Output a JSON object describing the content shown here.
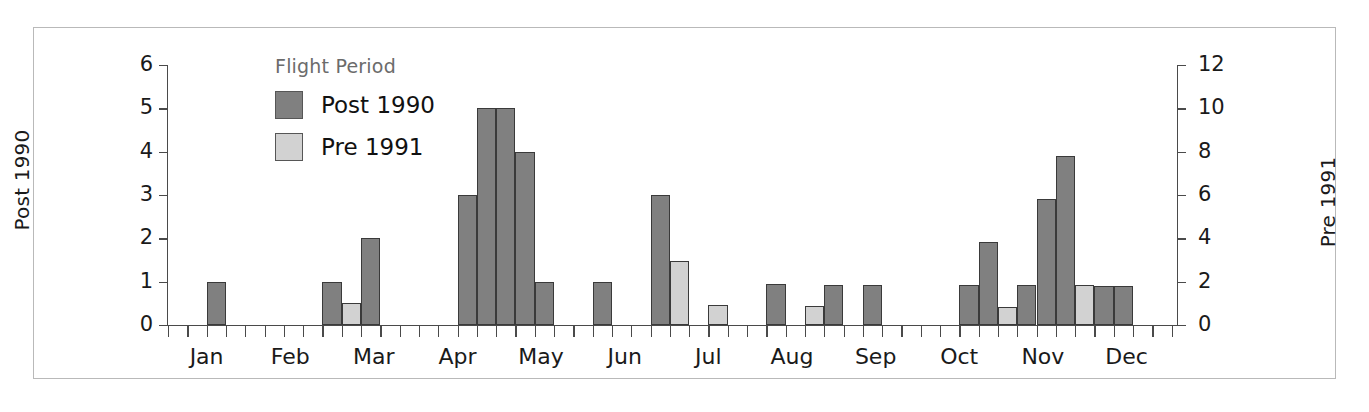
{
  "figure": {
    "border_color": "#b9b9b9",
    "background": "#ffffff"
  },
  "legend": {
    "title": "Flight Period",
    "position": "inside-top-left",
    "entries": [
      {
        "label": "Post 1990",
        "color": "#808080"
      },
      {
        "label": "Pre 1991",
        "color": "#d2d2d2"
      }
    ]
  },
  "axes": {
    "left": {
      "title": "Post 1990",
      "ticks": [
        0,
        1,
        2,
        3,
        4,
        5,
        6
      ],
      "min": 0,
      "max": 6
    },
    "right": {
      "title": "Pre 1991",
      "ticks": [
        0,
        2,
        4,
        6,
        8,
        10,
        12
      ],
      "min": 0,
      "max": 12
    },
    "x": {
      "labels": [
        "Jan",
        "Feb",
        "Mar",
        "Apr",
        "May",
        "Jun",
        "Jul",
        "Aug",
        "Sep",
        "Oct",
        "Nov",
        "Dec"
      ],
      "minor_ticks_per_month": 2
    }
  },
  "chart_data": {
    "type": "bar",
    "title": "",
    "xlabel": "",
    "ylabel": "Post 1990",
    "y2label": "Pre 1991",
    "ylim": [
      0,
      6
    ],
    "y2lim": [
      0,
      12
    ],
    "grid": false,
    "legend_title": "Flight Period",
    "legend_position": "inside-top-left",
    "bin_description": "half-month bins; 24 bins spanning Jan-Dec",
    "categories": [
      "Jan-1",
      "Jan-2",
      "Feb-1",
      "Feb-2",
      "Mar-1",
      "Mar-2",
      "Apr-1",
      "Apr-2",
      "May-1",
      "May-2",
      "Jun-1",
      "Jun-2",
      "Jul-1",
      "Jul-2",
      "Aug-1",
      "Aug-2",
      "Sep-1",
      "Sep-2",
      "Oct-1",
      "Oct-2",
      "Nov-1",
      "Nov-2",
      "Dec-1",
      "Dec-2"
    ],
    "series": [
      {
        "name": "Post 1990",
        "color": "#808080",
        "axis": "left",
        "bars": [
          {
            "bin": 2,
            "value": 1.0,
            "label": "Jan"
          },
          {
            "bin": 8,
            "value": 1.0,
            "label": "Feb"
          },
          {
            "bin": 10,
            "value": 2.0,
            "label": "Feb-late"
          },
          {
            "bin": 15,
            "value": 3.0,
            "label": "Apr"
          },
          {
            "bin": 16,
            "value": 5.0,
            "label": "Apr"
          },
          {
            "bin": 17,
            "value": 5.0,
            "label": "Apr-late"
          },
          {
            "bin": 18,
            "value": 4.0,
            "label": "May"
          },
          {
            "bin": 19,
            "value": 1.0,
            "label": "May"
          },
          {
            "bin": 22,
            "value": 1.0,
            "label": "Jun"
          },
          {
            "bin": 25,
            "value": 3.0,
            "label": "Jun-late"
          },
          {
            "bin": 31,
            "value": 0.95,
            "label": "Aug"
          },
          {
            "bin": 34,
            "value": 0.93,
            "label": "Aug-late"
          },
          {
            "bin": 36,
            "value": 0.93,
            "label": "Sep"
          },
          {
            "bin": 41,
            "value": 0.93,
            "label": "Oct"
          },
          {
            "bin": 42,
            "value": 1.92,
            "label": "Oct"
          },
          {
            "bin": 44,
            "value": 0.93,
            "label": "Oct-late"
          },
          {
            "bin": 45,
            "value": 2.9,
            "label": "Nov"
          },
          {
            "bin": 46,
            "value": 3.9,
            "label": "Nov"
          },
          {
            "bin": 48,
            "value": 0.9,
            "label": "Nov-late"
          },
          {
            "bin": 49,
            "value": 0.9,
            "label": "Nov-late"
          }
        ]
      },
      {
        "name": "Pre 1991",
        "color": "#d2d2d2",
        "axis": "right",
        "bars": [
          {
            "bin": 9,
            "value_right": 1.0,
            "value_left": 0.5,
            "label": "Feb"
          },
          {
            "bin": 26,
            "value_right": 3.0,
            "value_left": 1.48,
            "label": "Jun-late"
          },
          {
            "bin": 28,
            "value_right": 1.0,
            "value_left": 0.46,
            "label": "Jul"
          },
          {
            "bin": 33,
            "value_right": 0.9,
            "value_left": 0.44,
            "label": "Aug"
          },
          {
            "bin": 43,
            "value_right": 0.9,
            "value_left": 0.42,
            "label": "Oct"
          },
          {
            "bin": 45,
            "value_right": 1.9,
            "value_left": 0.93,
            "label": "Nov"
          },
          {
            "bin": 46,
            "value_right": 0.9,
            "value_left": 0.42,
            "label": "Nov"
          },
          {
            "bin": 47,
            "value_right": 1.9,
            "value_left": 0.93,
            "label": "Nov"
          }
        ]
      }
    ]
  },
  "geometry": {
    "plot_left_px": 168,
    "plot_top_px": 65,
    "plot_width_px": 1009,
    "plot_height_px": 260,
    "bin_width_px": 19.3,
    "n_bins": 52
  }
}
